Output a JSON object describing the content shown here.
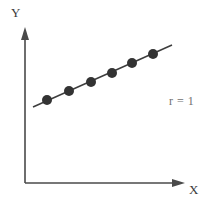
{
  "figure": {
    "background_color": "#ffffff",
    "axis_color": "#4a4a4a",
    "point_color": "#333333",
    "line_color": "#3d3d3d",
    "annotation_color": "#6f6f6f"
  },
  "axes": {
    "y_label": "Y",
    "x_label": "X",
    "origin": {
      "x": 25,
      "y": 183
    },
    "x_axis_end": {
      "x": 185,
      "y": 183
    },
    "y_axis_end": {
      "x": 25,
      "y": 28
    }
  },
  "annotation": {
    "text": "r = 1"
  },
  "chart_data": {
    "type": "scatter",
    "title": "",
    "subtitle": "",
    "xlabel": "X",
    "ylabel": "Y",
    "xlim": [
      0,
      10
    ],
    "ylim": [
      0,
      10
    ],
    "grid": false,
    "legend": null,
    "annotations": [
      {
        "text": "r = 1",
        "x": 9.05,
        "y": 5.35
      }
    ],
    "series": [
      {
        "name": "points",
        "marker": "filled-circle",
        "marker_size_px": 10,
        "color": "#333333",
        "points_px": [
          {
            "x": 47,
            "y": 100
          },
          {
            "x": 69,
            "y": 91
          },
          {
            "x": 91,
            "y": 82
          },
          {
            "x": 112,
            "y": 73
          },
          {
            "x": 132,
            "y": 63
          },
          {
            "x": 153,
            "y": 54
          }
        ],
        "x": [
          1.4,
          2.8,
          4.1,
          5.5,
          6.7,
          8.0
        ],
        "y": [
          5.4,
          5.9,
          6.5,
          7.1,
          7.7,
          8.3
        ]
      },
      {
        "name": "trend-line",
        "type": "line",
        "color": "#3d3d3d",
        "start_px": {
          "x": 33,
          "y": 107
        },
        "end_px": {
          "x": 172,
          "y": 45
        },
        "correlation": 1
      }
    ]
  }
}
